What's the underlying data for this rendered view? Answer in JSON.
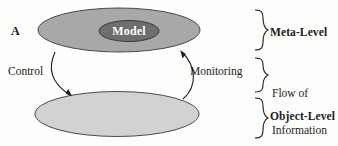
{
  "figure": {
    "label": "A",
    "top_ellipse": {
      "name": "meta-level-plane",
      "fill": "#a8a8a8",
      "stroke": "#4a4a4a"
    },
    "inner_ellipse": {
      "name": "model",
      "label": "Model",
      "fill": "#6e6e6e",
      "stroke": "#3a3a3a",
      "text_color": "#ffffff"
    },
    "bottom_ellipse": {
      "name": "object-level-plane",
      "fill": "#d2d2d2",
      "stroke": "#4a4a4a"
    },
    "arrows": [
      {
        "name": "control-arrow",
        "label": "Control",
        "direction": "meta-level to object-level"
      },
      {
        "name": "monitoring-arrow",
        "label": "Monitoring",
        "direction": "object-level to meta-level"
      }
    ],
    "brackets": [
      {
        "name": "meta-level-bracket",
        "label": "Meta-Level",
        "bold": true
      },
      {
        "name": "flow-of-information-bracket",
        "label_line1": "Flow of",
        "label_line2": "Information",
        "bold": false
      },
      {
        "name": "object-level-bracket",
        "label": "Object-Level",
        "bold": true
      }
    ],
    "colors": {
      "background": "#fdfdfb",
      "ink": "#1c1c1c",
      "line": "#4a4a4a"
    }
  }
}
